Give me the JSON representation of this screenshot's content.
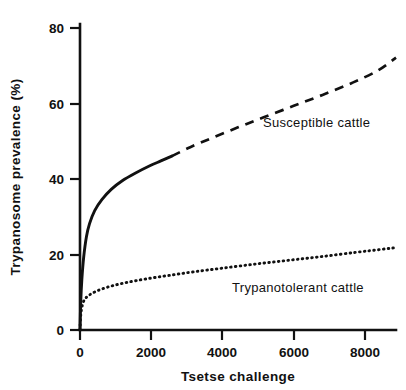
{
  "chart_data": {
    "type": "line",
    "title": "",
    "xlabel": "Tsetse challenge",
    "ylabel": "Trypanosome prevalence (%)",
    "xlim": [
      0,
      8600
    ],
    "ylim": [
      0,
      82
    ],
    "grid": false,
    "legend_position": "inline-annotation",
    "xticks": [
      0,
      2000,
      4000,
      6000,
      8000
    ],
    "xtick_labels": [
      "0",
      "2000",
      "4000",
      "6000",
      "8000"
    ],
    "yticks": [
      0,
      20,
      40,
      60,
      80
    ],
    "ytick_labels": [
      "0",
      "20",
      "40",
      "60",
      "80"
    ],
    "series": [
      {
        "name": "Susceptible cattle",
        "annotation": "Susceptible cattle",
        "style": "solid-then-dashed",
        "solid_range": [
          0,
          2500
        ],
        "dashed_range": [
          2500,
          8600
        ],
        "x": [
          0,
          20,
          50,
          100,
          175,
          260,
          400,
          600,
          850,
          1150,
          1500,
          1900,
          2200,
          2500,
          3000,
          3600,
          4300,
          5000,
          5800,
          6600,
          7400,
          8100,
          8600
        ],
        "y": [
          0,
          7.5,
          13.5,
          19.5,
          25,
          28.5,
          32,
          35,
          37.7,
          40,
          42,
          44,
          45.3,
          46.6,
          49,
          51.5,
          54.3,
          57,
          60,
          63,
          66.2,
          69.5,
          73
        ]
      },
      {
        "name": "Trypanotolerant cattle",
        "annotation": "Trypanotolerant cattle",
        "style": "dotted",
        "x": [
          0,
          15,
          40,
          90,
          160,
          260,
          400,
          600,
          900,
          1300,
          1800,
          2400,
          3100,
          3900,
          4800,
          5700,
          6600,
          7500,
          8200,
          8600
        ],
        "y": [
          0,
          3.2,
          5.5,
          7.5,
          8.6,
          9.4,
          10.2,
          11.0,
          11.9,
          12.8,
          13.7,
          14.6,
          15.6,
          16.6,
          17.7,
          18.7,
          19.7,
          20.8,
          21.6,
          22.1
        ]
      }
    ]
  },
  "annotations": {
    "susceptible_label": "Susceptible cattle",
    "trypanotolerant_label": "Trypanotolerant cattle"
  },
  "axes": {
    "x_title": "Tsetse challenge",
    "y_title": "Trypanosome prevalence (%)",
    "x_tick_labels": [
      "0",
      "2000",
      "4000",
      "6000",
      "8000"
    ],
    "y_tick_labels": [
      "0",
      "20",
      "40",
      "60",
      "80"
    ]
  },
  "colors": {
    "ink": "#111111",
    "background": "#ffffff"
  }
}
